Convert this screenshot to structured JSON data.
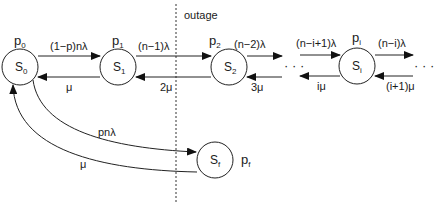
{
  "diagram": {
    "type": "markov-chain",
    "colors": {
      "stroke": "#222222",
      "text": "#1a1a1a",
      "background": "#ffffff"
    },
    "outage_label": "outage",
    "ellipsis": "· · ·",
    "states": [
      {
        "id": "S0",
        "label": "S",
        "sub": "0",
        "prob": "p",
        "prob_sub": "0"
      },
      {
        "id": "S1",
        "label": "S",
        "sub": "1",
        "prob": "p",
        "prob_sub": "1"
      },
      {
        "id": "S2",
        "label": "S",
        "sub": "2",
        "prob": "p",
        "prob_sub": "2"
      },
      {
        "id": "Si",
        "label": "S",
        "sub": "i",
        "prob": "p",
        "prob_sub": "i"
      },
      {
        "id": "Sf",
        "label": "S",
        "sub": "f",
        "prob": "p",
        "prob_sub": "f"
      }
    ],
    "transitions": [
      {
        "from": "S0",
        "to": "S1",
        "label": "(1−p)nλ"
      },
      {
        "from": "S1",
        "to": "S0",
        "label": "μ"
      },
      {
        "from": "S1",
        "to": "S2",
        "label": "(n−1)λ"
      },
      {
        "from": "S2",
        "to": "S1",
        "label": "2μ"
      },
      {
        "from": "S2",
        "to": "S3",
        "label": "(n−2)λ"
      },
      {
        "from": "S3",
        "to": "S2",
        "label": "3μ"
      },
      {
        "from": "Si-1",
        "to": "Si",
        "label": "(n−i+1)λ"
      },
      {
        "from": "Si",
        "to": "Si-1",
        "label": "iμ"
      },
      {
        "from": "Si",
        "to": "Si+1",
        "label": "(n−i)λ"
      },
      {
        "from": "Si+1",
        "to": "Si",
        "label": "(i+1)μ"
      },
      {
        "from": "S0",
        "to": "Sf",
        "label": "pnλ"
      },
      {
        "from": "Sf",
        "to": "S0",
        "label": "μ"
      }
    ]
  }
}
